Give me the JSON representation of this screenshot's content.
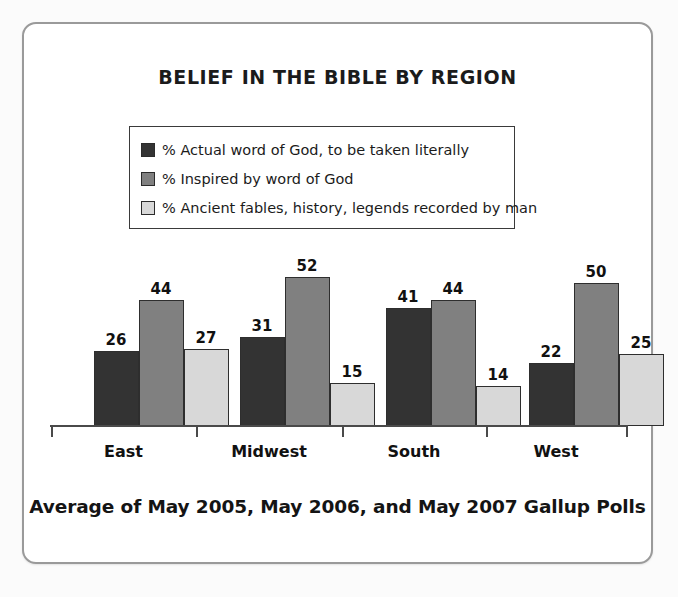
{
  "chart_data": {
    "type": "bar",
    "title": "BELIEF IN THE BIBLE BY REGION",
    "footer": "Average of May 2005, May 2006, and May 2007 Gallup Polls",
    "xlabel": "",
    "ylabel": "",
    "ylim": [
      0,
      60
    ],
    "grid": false,
    "legend_position": "top-center",
    "categories": [
      "East",
      "Midwest",
      "South",
      "West"
    ],
    "series": [
      {
        "name": "% Actual word of God, to be taken literally",
        "color": "#333333",
        "values": [
          26,
          31,
          41,
          22
        ]
      },
      {
        "name": "% Inspired by word of God",
        "color": "#808080",
        "values": [
          44,
          52,
          44,
          50
        ]
      },
      {
        "name": "% Ancient fables, history, legends recorded by man",
        "color": "#d8d8d8",
        "values": [
          27,
          15,
          14,
          25
        ]
      }
    ]
  },
  "legend": {
    "items": [
      {
        "label": "% Actual word of God, to be taken literally",
        "color": "#333333",
        "swatch_name": "legend-swatch-dark"
      },
      {
        "label": "% Inspired by word of God",
        "color": "#808080",
        "swatch_name": "legend-swatch-medium"
      },
      {
        "label": "% Ancient fables, history, legends recorded by man",
        "color": "#d8d8d8",
        "swatch_name": "legend-swatch-light"
      }
    ]
  },
  "colors": {
    "card_background": "#ffffff",
    "card_border": "#9a9a9a",
    "page_background": "#fbfbfb",
    "axis": "#4a4a4a",
    "text": "#111111",
    "series_dark": "#333333",
    "series_medium": "#808080",
    "series_light": "#d8d8d8"
  }
}
